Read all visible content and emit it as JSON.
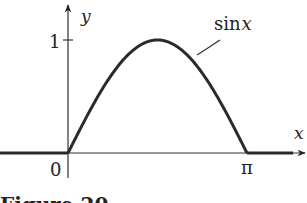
{
  "chart_data": {
    "type": "line",
    "title": "",
    "xlabel": "x",
    "ylabel": "y",
    "function_label": "sin x",
    "function_label_parts": {
      "fn": "sin",
      "var": "x"
    },
    "x_ticks": [
      {
        "value": 0,
        "label": "0"
      },
      {
        "value": 3.14159,
        "label": "π"
      }
    ],
    "y_ticks": [
      {
        "value": 1,
        "label": "1"
      }
    ],
    "xlim": [
      -1.2,
      4.0
    ],
    "ylim": [
      0,
      1.3
    ],
    "series": [
      {
        "name": "f(x) = 0 for x < 0",
        "domain": [
          -1.2,
          0
        ],
        "expr": "0"
      },
      {
        "name": "sin x",
        "domain": [
          0,
          3.14159
        ],
        "expr": "sin"
      },
      {
        "name": "f(x) = 0 for x > π",
        "domain": [
          3.14159,
          3.95
        ],
        "expr": "0"
      }
    ],
    "grid": false,
    "legend": "none"
  },
  "caption": "Figure 20"
}
